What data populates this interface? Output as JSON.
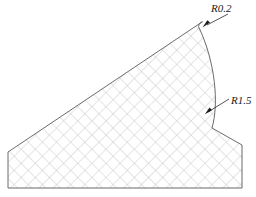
{
  "drawing": {
    "title": "Hatched cross-section profile with fillet radii",
    "canvas": {
      "width": 256,
      "height": 197
    },
    "background_color": "#ffffff",
    "outline_color": "#5a5a5a",
    "hatch_color": "#b4b4b4",
    "leader_color": "#2a2a2a",
    "annotations": [
      {
        "id": "r02",
        "label": "R0.2",
        "label_x": 211,
        "label_y": 12,
        "leader_points": "228,14 207,25",
        "arrow_points": "202.5,27.5 210,22.4 207.4,20.2",
        "description": "small fillet radius at apex tip"
      },
      {
        "id": "r15",
        "label": "R1.5",
        "label_x": 231,
        "label_y": 104,
        "leader_points": "229,99 208,112",
        "arrow_points": "204.8,114.2 212,110.3 209.6,107.6",
        "description": "large concave fillet radius on right flank"
      }
    ],
    "profile": {
      "apex": {
        "x": 202,
        "y": 22
      },
      "left_top": {
        "x": 8,
        "y": 152
      },
      "left_bottom": {
        "x": 8,
        "y": 188
      },
      "right_bottom": {
        "x": 242,
        "y": 188
      },
      "right_step": {
        "x": 242,
        "y": 145
      },
      "arc_tangent": {
        "x": 212,
        "y": 128
      },
      "outline_path": "M 202 22 L 8 152 L 8 188 L 242 188 L 242 145 L 212 128 C 219 104 215.5 62 198.5 26.5 C 199.3 23.5 200.6 22.1 202 22 Z"
    },
    "hatch": {
      "pattern": "cross-hatch",
      "angle_degrees": 45,
      "spacing_px": 10,
      "line_width": 0.7
    }
  }
}
